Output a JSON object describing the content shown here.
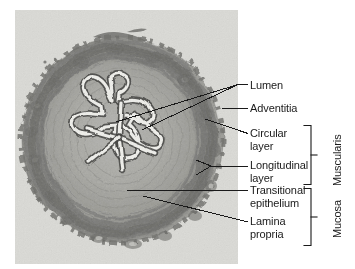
{
  "figure": {
    "type": "histology-micrograph-annotated",
    "background_color": "#ffffff",
    "label_color": "#1a1a1a",
    "leader_line_color": "#1a1a1a",
    "micrograph_tint": "#c9c9c4"
  },
  "labels": [
    {
      "id": "lumen",
      "text": "Lumen"
    },
    {
      "id": "adventitia",
      "text": "Adventitia"
    },
    {
      "id": "circular-layer",
      "text": "Circular\nlayer"
    },
    {
      "id": "longitudinal-layer",
      "text": "Longitudinal\nlayer"
    },
    {
      "id": "transitional-epithelium",
      "text": "Transitional\nepithelium"
    },
    {
      "id": "lamina-propria",
      "text": "Lamina\npropria"
    }
  ],
  "brackets": [
    {
      "id": "muscularis",
      "text": "Muscularis"
    },
    {
      "id": "mucosa",
      "text": "Mucosa"
    }
  ]
}
